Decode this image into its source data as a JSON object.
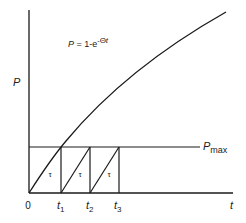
{
  "diagram": {
    "y_axis_label": "P",
    "x_axis_label": "t",
    "formula": {
      "lhs": "P",
      "eq": " = 1-e",
      "exponent_sign": "-",
      "exponent_theta": "Θ",
      "exponent_t": "t"
    },
    "pmax_label": {
      "main": "P",
      "sub": "max"
    },
    "origin_label": "0",
    "ticks": [
      {
        "main": "t",
        "sub": "1"
      },
      {
        "main": "t",
        "sub": "2"
      },
      {
        "main": "t",
        "sub": "3"
      }
    ],
    "tau_labels": [
      "τ",
      "τ",
      "τ"
    ],
    "line_color": "#1a1a1a"
  }
}
